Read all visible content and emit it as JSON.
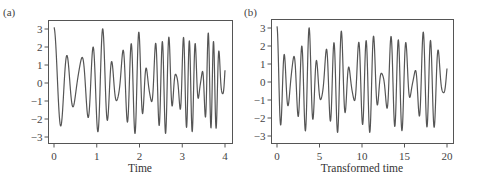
{
  "chart_data": [
    {
      "type": "line",
      "panel": "(a)",
      "title": "",
      "xlabel": "Time",
      "ylabel": "",
      "xlim": [
        0,
        4
      ],
      "ylim": [
        -3.3,
        3.3
      ],
      "xticks": [
        0,
        1,
        2,
        3,
        4
      ],
      "yticks": [
        -3,
        -2,
        -1,
        0,
        1,
        2,
        3
      ],
      "grid": false,
      "legend": null,
      "description": "Chirp-like oscillation: frequency increases with time; amplitude varies roughly between 1 and 3",
      "series": [
        {
          "name": "signal",
          "approx_extrema": [
            {
              "x": 0.0,
              "y": 3.1
            },
            {
              "x": 0.22,
              "y": -1.3
            },
            {
              "x": 0.36,
              "y": 2.8
            },
            {
              "x": 0.5,
              "y": -2.0
            },
            {
              "x": 0.6,
              "y": 1.4
            },
            {
              "x": 0.72,
              "y": -2.8
            },
            {
              "x": 0.82,
              "y": 1.5
            },
            {
              "x": 0.92,
              "y": -1.5
            },
            {
              "x": 1.0,
              "y": 2.8
            },
            {
              "x": 1.1,
              "y": -1.5
            },
            {
              "x": 1.22,
              "y": -3.0
            },
            {
              "x": 1.3,
              "y": 1.6
            },
            {
              "x": 1.43,
              "y": 2.9
            },
            {
              "x": 1.6,
              "y": -2.6
            },
            {
              "x": 2.0,
              "y": 2.7
            },
            {
              "x": 2.75,
              "y": -3.1
            },
            {
              "x": 3.0,
              "y": 3.0
            },
            {
              "x": 4.0,
              "y": 3.1
            }
          ]
        }
      ]
    },
    {
      "type": "line",
      "panel": "(b)",
      "title": "",
      "xlabel": "Transformed time",
      "ylabel": "",
      "xlim": [
        0,
        20
      ],
      "ylim": [
        -3.3,
        3.3
      ],
      "xticks": [
        0,
        5,
        10,
        15,
        20
      ],
      "yticks": [
        -3,
        -2,
        -1,
        0,
        1,
        2,
        3
      ],
      "grid": false,
      "legend": null,
      "description": "Same signal against transformed time: approximately constant frequency (~1 cycle per unit), amplitude between ~1 and 3",
      "series": [
        {
          "name": "signal",
          "approx_extrema": [
            {
              "x": 0.0,
              "y": 3.1
            },
            {
              "x": 0.4,
              "y": -1.2
            },
            {
              "x": 0.7,
              "y": 2.7
            },
            {
              "x": 1.0,
              "y": -2.0
            },
            {
              "x": 1.3,
              "y": 1.3
            },
            {
              "x": 1.6,
              "y": -2.9
            },
            {
              "x": 2.1,
              "y": 2.8
            },
            {
              "x": 3.0,
              "y": -2.9
            },
            {
              "x": 3.6,
              "y": 2.8
            },
            {
              "x": 6.8,
              "y": -2.8
            },
            {
              "x": 8.6,
              "y": 2.8
            },
            {
              "x": 10.2,
              "y": -3.1
            },
            {
              "x": 13.7,
              "y": -2.9
            },
            {
              "x": 15.3,
              "y": 2.8
            },
            {
              "x": 18.1,
              "y": -2.8
            },
            {
              "x": 20.0,
              "y": 3.1
            }
          ]
        }
      ]
    }
  ],
  "panels": {
    "a": {
      "label": "(a)",
      "xlabel": "Time",
      "xtick_labels": [
        "0",
        "1",
        "2",
        "3",
        "4"
      ],
      "ytick_labels": [
        "3",
        "2",
        "1",
        "0",
        "−1",
        "−2",
        "−3"
      ]
    },
    "b": {
      "label": "(b)",
      "xlabel": "Transformed time",
      "xtick_labels": [
        "0",
        "5",
        "10",
        "15",
        "20"
      ],
      "ytick_labels": [
        "3",
        "2",
        "1",
        "0",
        "−1",
        "−2",
        "−3"
      ]
    }
  },
  "colors": {
    "trace": "#555555",
    "frame": "#555555",
    "text": "#444444"
  }
}
